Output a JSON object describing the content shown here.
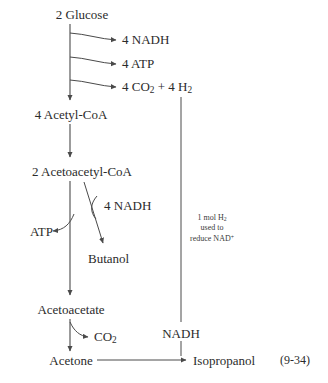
{
  "figure": {
    "equation_number": "(9-34)",
    "stroke_color": "#4a4a4a",
    "text_color": "#2b2b2b",
    "background_color": "#ffffff"
  },
  "nodes": {
    "glucose": "2 Glucose",
    "acetyl_coa": "4 Acetyl-CoA",
    "acetoacetyl_coa": "2 Acetoacetyl-CoA",
    "acetoacetate": "Acetoacetate",
    "acetone": "Acetone",
    "butanol": "Butanol",
    "isopropanol": "Isopropanol"
  },
  "branch_products": {
    "nadh_4": "4 NADH",
    "atp_4": "4 ATP",
    "co2_h2": "4 CO",
    "co2_h2_sub1": "2",
    "co2_h2_mid": " + 4 H",
    "co2_h2_sub2": "2",
    "nadh_4_butanol": "4 NADH",
    "atp": "ATP",
    "co2": "CO",
    "co2_sub": "2",
    "nadh_bottom": "NADH"
  },
  "annotation": {
    "line1": "1 mol H",
    "line1_sub": "2",
    "line2": "used to",
    "line3": "reduce NAD",
    "line3_sup": "+"
  }
}
